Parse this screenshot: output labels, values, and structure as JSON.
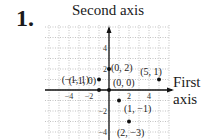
{
  "problem_number": "1.",
  "chart_data": {
    "type": "scatter",
    "title": "",
    "ylabel": "Second axis",
    "xlabel_line1": "First",
    "xlabel_line2": "axis",
    "xlim": [
      -6,
      6
    ],
    "ylim": [
      -5,
      6
    ],
    "grid": true,
    "x_ticks": [
      -4,
      -2,
      2,
      4
    ],
    "y_ticks": [
      4,
      2,
      -2,
      -4
    ],
    "x_tick_labels": [
      "−4",
      "−2",
      "2",
      "4"
    ],
    "y_tick_labels": [
      "4",
      "2",
      "−2",
      "−4"
    ],
    "points": [
      {
        "x": 0,
        "y": 2,
        "label": "(0, 2)"
      },
      {
        "x": 5,
        "y": 1,
        "label": "(5, 1)"
      },
      {
        "x": -1,
        "y": 1,
        "label": "(−1, 1)"
      },
      {
        "x": -1,
        "y": 0,
        "label": "(−1, 0)"
      },
      {
        "x": 0,
        "y": 0,
        "label": "(0, 0)"
      },
      {
        "x": 1,
        "y": -1,
        "label": "(1, −1)"
      },
      {
        "x": 2,
        "y": -3,
        "label": "(2, −3)"
      }
    ]
  }
}
